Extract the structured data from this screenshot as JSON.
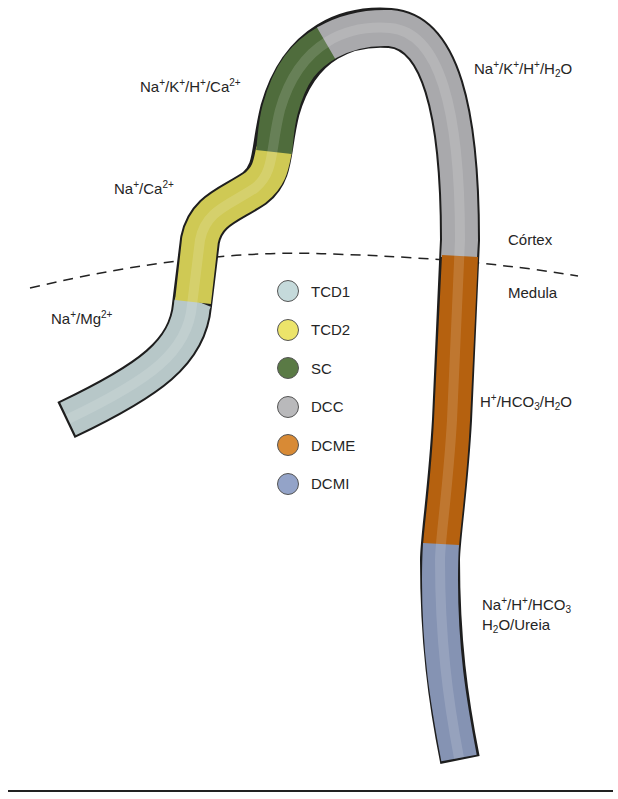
{
  "diagram": {
    "regions": {
      "cortex_label": "Córtex",
      "medulla_label": "Medula"
    },
    "transport_labels": {
      "tcd1": {
        "parts": [
          [
            "Na",
            ""
          ],
          [
            "+",
            "sup"
          ],
          [
            "/Mg",
            ""
          ],
          [
            "2+",
            "sup"
          ]
        ],
        "text": "Na+/Mg2+"
      },
      "tcd2": {
        "parts": [
          [
            "Na",
            ""
          ],
          [
            "+",
            "sup"
          ],
          [
            "/Ca",
            ""
          ],
          [
            "2+",
            "sup"
          ]
        ],
        "text": "Na+/Ca2+"
      },
      "sc": {
        "parts": [
          [
            "Na",
            ""
          ],
          [
            "+",
            "sup"
          ],
          [
            "/K",
            ""
          ],
          [
            "+",
            "sup"
          ],
          [
            "/H",
            ""
          ],
          [
            "+",
            "sup"
          ],
          [
            "/Ca",
            ""
          ],
          [
            "2+",
            "sup"
          ]
        ],
        "text": "Na+/K+/H+/Ca2+"
      },
      "dcc": {
        "parts": [
          [
            "Na",
            ""
          ],
          [
            "+",
            "sup"
          ],
          [
            "/K",
            ""
          ],
          [
            "+",
            "sup"
          ],
          [
            "/H",
            ""
          ],
          [
            "+",
            "sup"
          ],
          [
            "/H",
            ""
          ],
          [
            "2",
            "sub"
          ],
          [
            "O",
            ""
          ]
        ],
        "text": "Na+/K+/H+/H2O"
      },
      "dcme": {
        "parts": [
          [
            "H",
            ""
          ],
          [
            "+",
            "sup"
          ],
          [
            "/HCO",
            ""
          ],
          [
            "3",
            "sub"
          ],
          [
            "/H",
            ""
          ],
          [
            "2",
            "sub"
          ],
          [
            "O",
            ""
          ]
        ],
        "text": "H+/HCO3/H2O"
      },
      "dcmi_line1": {
        "parts": [
          [
            "Na",
            ""
          ],
          [
            "+",
            "sup"
          ],
          [
            "/H",
            ""
          ],
          [
            "+",
            "sup"
          ],
          [
            "/HCO",
            ""
          ],
          [
            "3",
            "sub"
          ]
        ],
        "text": "Na+/H+/HCO3"
      },
      "dcmi_line2": {
        "parts": [
          [
            "H",
            ""
          ],
          [
            "2",
            "sub"
          ],
          [
            "O/Ureia",
            ""
          ]
        ],
        "text": "H2O/Ureia"
      }
    },
    "legend": [
      {
        "key": "TCD1",
        "label": "TCD1",
        "color": "#c5dadb"
      },
      {
        "key": "TCD2",
        "label": "TCD2",
        "color": "#ece46a"
      },
      {
        "key": "SC",
        "label": "SC",
        "color": "#5a7a45"
      },
      {
        "key": "DCC",
        "label": "DCC",
        "color": "#b9b9bb"
      },
      {
        "key": "DCME",
        "label": "DCME",
        "color": "#d88a35"
      },
      {
        "key": "DCMI",
        "label": "DCMI",
        "color": "#93a3c8"
      }
    ],
    "segment_colors": {
      "tcd1": "#b7c7c8",
      "tcd2": "#cfc954",
      "sc": "#4f6c3c",
      "dcc": "#a9a9ac",
      "dcme": "#b5610f",
      "dcmi": "#8593b3",
      "outline": "#1e1e1e"
    }
  }
}
